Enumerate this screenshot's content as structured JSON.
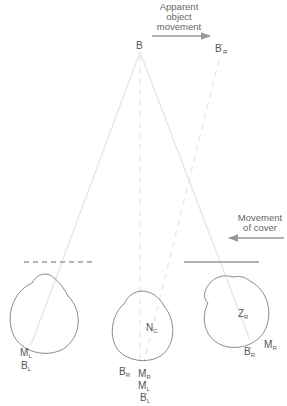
{
  "diagram": {
    "type": "cover-test illustration",
    "annotations": {
      "apparent_movement": [
        "Apparent",
        "object",
        "movement"
      ],
      "cover_movement": [
        "Movement",
        "of cover"
      ]
    },
    "points": {
      "object": {
        "main": "B",
        "sub": "",
        "prime": ""
      },
      "displaced_object": {
        "main": "B",
        "sub": "R",
        "prime": "''"
      }
    },
    "left_eye": {
      "cover": "dashed",
      "labels": [
        {
          "main": "M",
          "sub": "L",
          "prime": "'"
        },
        {
          "main": "B",
          "sub": "L",
          "prime": "'"
        }
      ]
    },
    "cyclopean_eye": {
      "center_label": {
        "main": "N",
        "sub": "C"
      },
      "labels": [
        {
          "main": "B",
          "sub": "R",
          "prime": "'"
        },
        {
          "main": "M",
          "sub": "R",
          "prime": "'"
        },
        {
          "main": "M",
          "sub": "L",
          "prime": "'"
        },
        {
          "main": "B",
          "sub": "L",
          "prime": "'"
        }
      ]
    },
    "right_eye": {
      "cover": "solid",
      "center_label": {
        "main": "Z",
        "sub": "R"
      },
      "labels": [
        {
          "main": "B",
          "sub": "R",
          "prime": "'"
        },
        {
          "main": "M",
          "sub": "R",
          "prime": "'"
        }
      ]
    },
    "colors": {
      "eye_outline": "#8a8a8a",
      "ray_line": "#e6e6e6",
      "arrow": "#999999",
      "cover": "#999999",
      "text": "#555555"
    }
  }
}
